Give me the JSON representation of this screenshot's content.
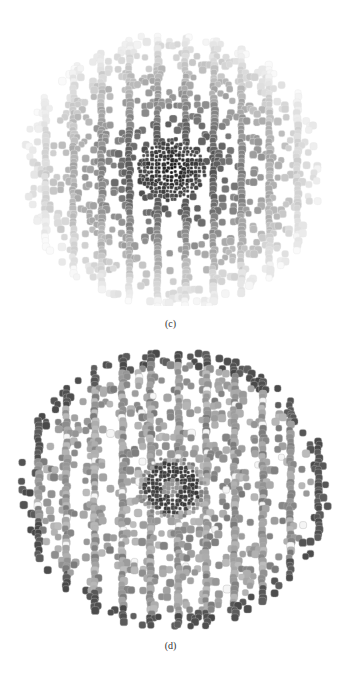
{
  "figure": {
    "panels": [
      {
        "id": "c",
        "caption": "(c)",
        "description": "Cell tessellation shaded with dark center fading to light periphery (radial gradient)",
        "shape": {
          "cx": 170,
          "cy": 168,
          "rx": 152,
          "ry": 138
        },
        "shading": {
          "center": "#111111",
          "edge": "#f2f2f2",
          "cell_border": "#e8e8e8"
        }
      },
      {
        "id": "d",
        "caption": "(d)",
        "description": "Cell tessellation with mid-gray cells, dark outer ring, dark small-cell central region and scattered white cells",
        "shape": {
          "cx": 170,
          "cy": 146,
          "rx": 155,
          "ry": 140
        },
        "shading": {
          "base": "#8c8c8c",
          "outer_ring": "#4a4a4a",
          "center_ring": "#333333",
          "light_cell": "#f5f5f5",
          "cell_border": "#b0b0b0"
        }
      }
    ]
  }
}
